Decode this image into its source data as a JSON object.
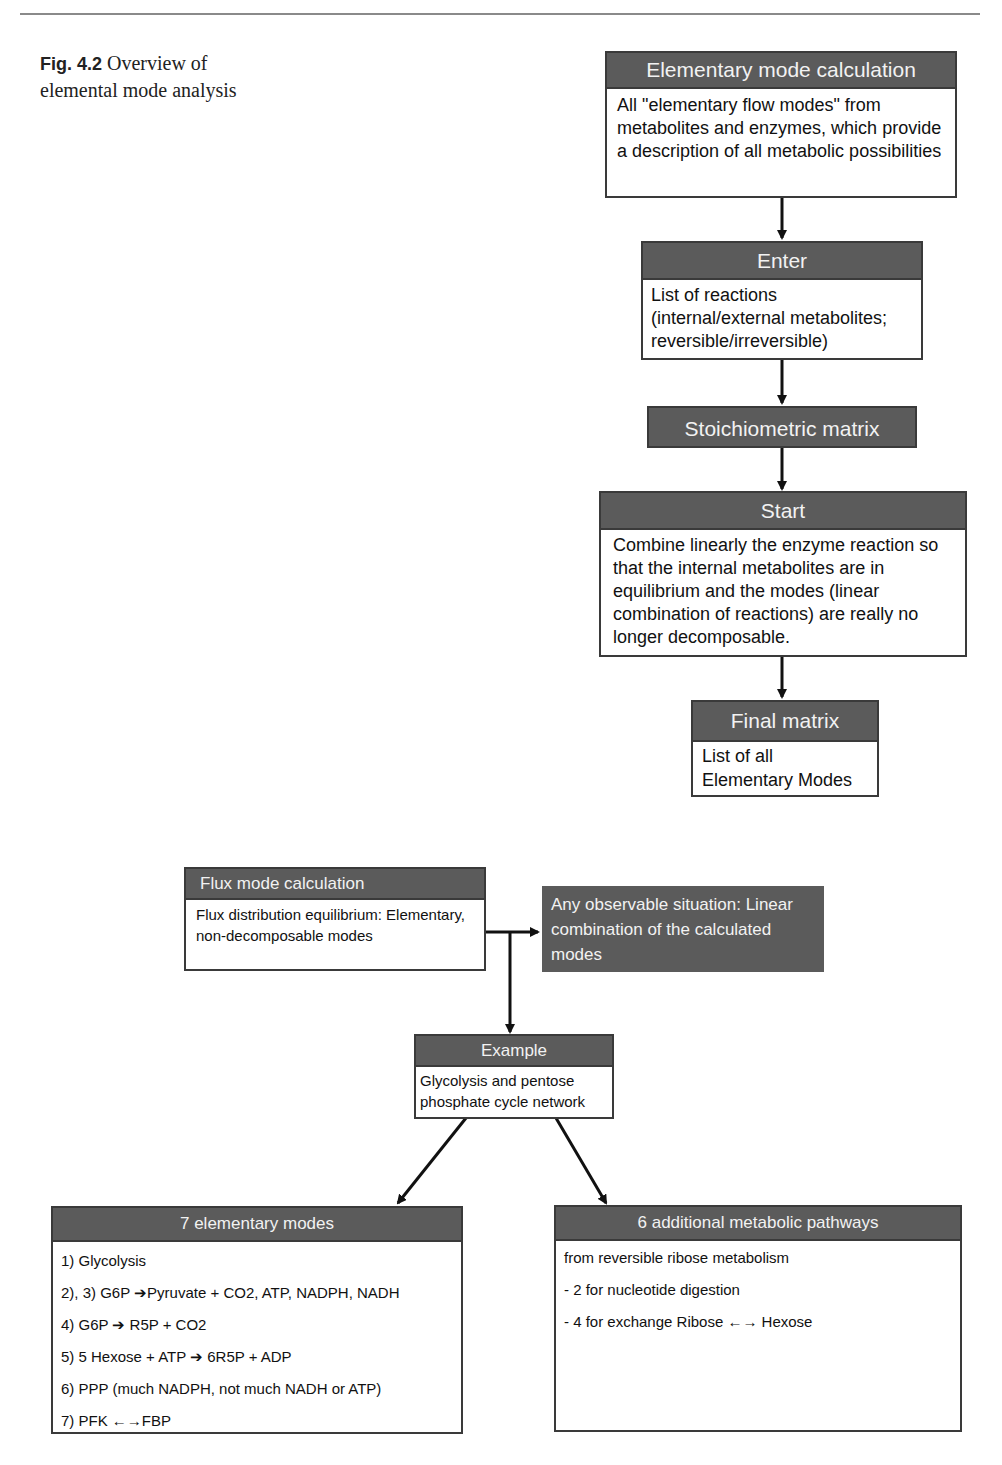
{
  "figure": {
    "number": "Fig. 4.2",
    "caption": "Overview of elemental mode analysis"
  },
  "flowchart_top": {
    "elementary_mode_calculation": {
      "title": "Elementary mode calculation",
      "body": "All \"elementary flow modes\" from metabolites and enzymes, which provide a description of all metabolic possibilities"
    },
    "enter": {
      "title": "Enter",
      "body": "List of reactions (internal/external metabolites; reversible/irreversible)"
    },
    "stoichiometric_matrix": {
      "title": "Stoichiometric matrix"
    },
    "start": {
      "title": "Start",
      "body": "Combine linearly the enzyme reaction so that the internal metabolites are in equilibrium and the modes (linear combination of reactions) are really no longer decomposable."
    },
    "final_matrix": {
      "title": "Final matrix",
      "body": "List of all Elementary Modes"
    }
  },
  "flowchart_bottom": {
    "flux_mode_calculation": {
      "title": "Flux mode calculation",
      "body": "Flux distribution equilibrium: Elementary, non-decomposable modes"
    },
    "observable_situation": {
      "body": "Any observable situation: Linear combination of the calculated modes"
    },
    "example": {
      "title": "Example",
      "body": "Glycolysis and pentose phosphate cycle network"
    },
    "elementary_modes": {
      "title": "7 elementary modes",
      "items": [
        "1) Glycolysis",
        "2), 3) G6P ➔Pyruvate + CO2, ATP, NADPH, NADH",
        "4) G6P ➔ R5P + CO2",
        "5) 5 Hexose + ATP ➔ 6R5P + ADP",
        "6) PPP (much NADPH, not much NADH or ATP)",
        "7) PFK ←→FBP"
      ]
    },
    "additional_pathways": {
      "title": "6 additional metabolic pathways",
      "items": [
        "from reversible ribose metabolism",
        "- 2 for nucleotide digestion",
        "- 4 for exchange Ribose ←→ Hexose"
      ]
    }
  },
  "colors": {
    "header_fill": "#5b5b5b",
    "header_text": "#f2f2f2",
    "border": "#3a3a3a",
    "arrow": "#111111"
  }
}
